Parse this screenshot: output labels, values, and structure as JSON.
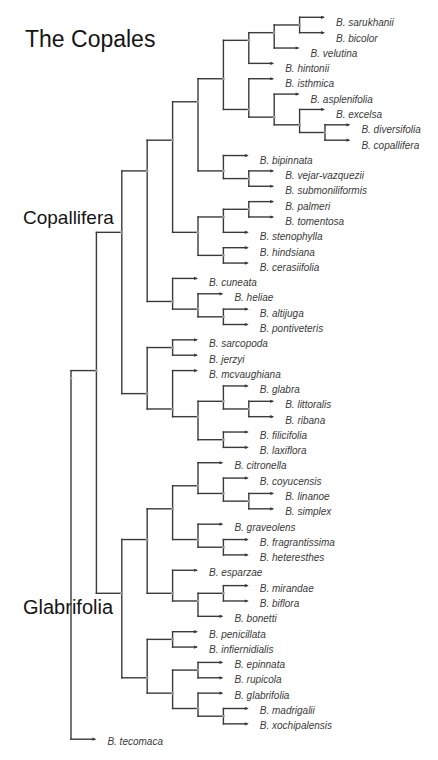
{
  "figure": {
    "title": "The Copales",
    "clade_labels": {
      "copallifera": "Copallifera",
      "glabrifolia": "Glabrifolia"
    }
  },
  "tree": {
    "leaves": [
      "B. sarukhanii",
      "B. bicolor",
      "B. velutina",
      "B. hintonii",
      "B. isthmica",
      "B. asplenifolia",
      "B. excelsa",
      "B. diversifolia",
      "B. copallifera",
      "B. bipinnata",
      "B. vejar-vazquezii",
      "B. submoniliformis",
      "B. palmeri",
      "B. tomentosa",
      "B. stenophylla",
      "B. hindsiana",
      "B. cerasiifolia",
      "B. cuneata",
      "B. heliae",
      "B. altijuga",
      "B. pontiveteris",
      "B. sarcopoda",
      "B. jerzyi",
      "B. mcvaughiana",
      "B. glabra",
      "B. littoralis",
      "B. ribana",
      "B. filicifolia",
      "B. laxiflora",
      "B. citronella",
      "B. coyucensis",
      "B. linanoe",
      "B. simplex",
      "B. graveolens",
      "B. fragrantissima",
      "B. heteresthes",
      "B. esparzae",
      "B. mirandae",
      "B. biflora",
      "B. bonetti",
      "B. penicillata",
      "B. infiernidialis",
      "B. epinnata",
      "B. rupicola",
      "B. glabrifolia",
      "B. madrigalii",
      "B. xochipalensis",
      "B. tecomaca"
    ],
    "topology": [
      [
        [
          [
            [
              [
                [
                  [
                    [
                      [
                        0,
                        1
                      ],
                      2
                    ],
                    3
                  ],
                  [
                    4,
                    [
                      5,
                      [
                        6,
                        [
                          7,
                          8
                        ]
                      ]
                    ]
                  ]
                ],
                [
                  9,
                  [
                    10,
                    11
                  ]
                ]
              ],
              [
                [
                  [
                    12,
                    13
                  ],
                  14
                ],
                [
                  15,
                  16
                ]
              ]
            ],
            [
              17,
              [
                18,
                [
                  19,
                  20
                ]
              ]
            ]
          ],
          [
            [
              21,
              22
            ],
            [
              23,
              [
                [
                  24,
                  [
                    25,
                    26
                  ]
                ],
                [
                  27,
                  28
                ]
              ]
            ]
          ]
        ],
        [
          [
            [
              [
                29,
                [
                  30,
                  [
                    31,
                    32
                  ]
                ]
              ],
              [
                33,
                [
                  34,
                  35
                ]
              ]
            ],
            [
              36,
              [
                [
                  37,
                  38
                ],
                39
              ]
            ]
          ],
          [
            [
              40,
              41
            ],
            [
              [
                42,
                43
              ],
              [
                44,
                [
                  45,
                  46
                ]
              ]
            ]
          ]
        ]
      ],
      47
    ],
    "outgroup": "B. tecomaca"
  },
  "colors": {
    "branch": "#3a3a3a",
    "label": "#3a3a3a",
    "node_dot": "#9a9a9a",
    "title": "#151515"
  }
}
